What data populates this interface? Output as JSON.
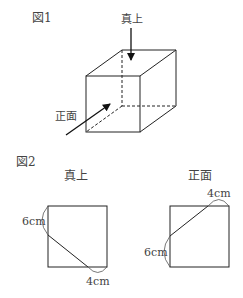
{
  "figure1": {
    "title": "図1",
    "top_label": "真上",
    "front_label": "正面"
  },
  "figure2": {
    "title": "図2",
    "top_view": {
      "label": "真上",
      "side_measure": "6cm",
      "bottom_measure": "4cm"
    },
    "front_view": {
      "label": "正面",
      "top_measure": "4cm",
      "side_measure": "6cm"
    }
  },
  "colors": {
    "line": "#222222",
    "text": "#444444"
  }
}
